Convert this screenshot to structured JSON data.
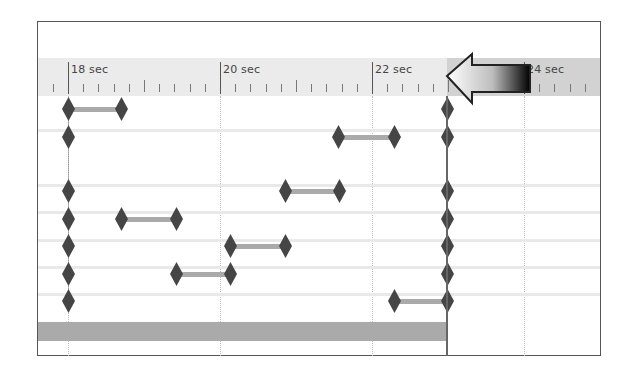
{
  "timeline": {
    "ruler": {
      "labels": [
        {
          "text": "18 sec",
          "x": 68
        },
        {
          "text": "20 sec",
          "x": 220
        },
        {
          "text": "22 sec",
          "x": 372
        },
        {
          "text": "24 sec",
          "x": 524
        }
      ],
      "seconds_per_major": 2,
      "px_per_second": 76
    },
    "playhead": {
      "time_sec": 23.0,
      "x": 447
    },
    "playhead_arrow": {
      "icon": "left-arrow-icon",
      "gradient_from": "#ffffff",
      "gradient_to": "#000000"
    },
    "rows": [
      {
        "y": 109,
        "keyframes": [
          68,
          121
        ],
        "playhead_key": true
      },
      {
        "y": 137,
        "keyframes": [
          68,
          338,
          394
        ],
        "span": [
          338,
          394
        ],
        "playhead_key": true
      },
      {
        "y": 191,
        "keyframes": [
          68,
          285,
          339
        ],
        "span": [
          285,
          339
        ],
        "playhead_key": true
      },
      {
        "y": 219,
        "keyframes": [
          68,
          121,
          176
        ],
        "span": [
          121,
          176
        ],
        "playhead_key": true
      },
      {
        "y": 246,
        "keyframes": [
          68,
          230,
          285
        ],
        "span": [
          230,
          285
        ],
        "playhead_key": true
      },
      {
        "y": 274,
        "keyframes": [
          68,
          176,
          230
        ],
        "span": [
          176,
          230
        ],
        "playhead_key": true
      },
      {
        "y": 301,
        "keyframes": [
          68,
          394
        ],
        "span": [
          394,
          447
        ],
        "playhead_key": true
      }
    ],
    "first_row_span": [
      68,
      121
    ],
    "separators_y": [
      130,
      185,
      212,
      240,
      267,
      294
    ],
    "bottom_track": {
      "x_start": 38,
      "x_end": 447
    },
    "colors": {
      "header_left": "#ebebeb",
      "header_right": "#d2d2d2",
      "keyframe": "#454545",
      "span_bar": "#aaaaaa",
      "playhead": "#666666"
    }
  }
}
